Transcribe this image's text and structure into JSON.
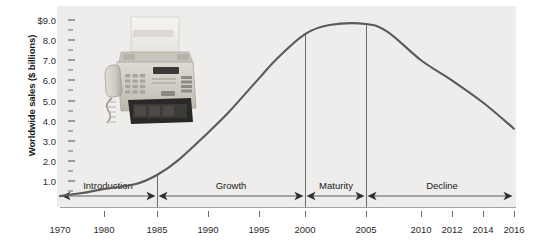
{
  "chart_data": {
    "type": "line",
    "title": "",
    "subtitle": "",
    "xlabel": "",
    "ylabel": "Worldwide sales ($ billions)",
    "xlim": [
      1970,
      2016
    ],
    "ylim": [
      0,
      9.0
    ],
    "grid": false,
    "legend": null,
    "x_tick_labels": [
      "1970",
      "1980",
      "1985",
      "1990",
      "1995",
      "2000",
      "2005",
      "2010",
      "2012",
      "2014",
      "2016"
    ],
    "x_tick_values": [
      1970,
      1980,
      1985,
      1990,
      1995,
      2000,
      2005,
      2010,
      2012,
      2014,
      2016
    ],
    "x_tick_px": [
      60,
      104,
      157,
      208,
      259,
      305,
      366,
      421,
      452,
      483,
      514
    ],
    "y_tick_labels": [
      "$9.0",
      "8.0",
      "7.0",
      "6.0",
      "5.0",
      "4.0",
      "3.0",
      "2.0",
      "1.0"
    ],
    "y_tick_values": [
      9.0,
      8.0,
      7.0,
      6.0,
      5.0,
      4.0,
      3.0,
      2.0,
      1.0
    ],
    "y_minor_tick_values": [
      8.5,
      7.5,
      6.5,
      5.5,
      4.5,
      3.5,
      2.5,
      1.5,
      0.5
    ],
    "series": [
      {
        "name": "Worldwide fax machine sales",
        "color": "#5a5a5a",
        "x": [
          1970,
          1975,
          1980,
          1983,
          1985,
          1987,
          1990,
          1992,
          1995,
          1997,
          2000,
          2002,
          2005,
          2007,
          2010,
          2012,
          2014,
          2016
        ],
        "values": [
          0.25,
          0.4,
          0.6,
          0.85,
          1.3,
          2.0,
          3.4,
          4.4,
          6.1,
          7.1,
          8.3,
          8.75,
          8.8,
          8.4,
          7.0,
          6.0,
          4.9,
          3.6
        ]
      }
    ],
    "stages": [
      {
        "label": "Introduction",
        "start_year": 1970,
        "end_year": 1985,
        "center_px": 108
      },
      {
        "label": "Growth",
        "start_year": 1985,
        "end_year": 2000,
        "center_px": 231
      },
      {
        "label": "Maturity",
        "start_year": 2000,
        "end_year": 2005,
        "center_px": 336
      },
      {
        "label": "Decline",
        "start_year": 2005,
        "end_year": 2016,
        "center_px": 442
      }
    ],
    "stage_dividers_px": [
      157,
      305,
      366
    ],
    "annotations": [
      {
        "name": "product-photo",
        "kind": "image",
        "description": "fax machine"
      }
    ],
    "colors": {
      "plot_background": "#eeedeb",
      "page_background": "#ffffff",
      "curve": "#5a5a5a",
      "axis": "#6b6b6b",
      "text": "#1a1a1a"
    }
  },
  "figure": {
    "y_axis_title": "Worldwide sales ($ billions)"
  }
}
